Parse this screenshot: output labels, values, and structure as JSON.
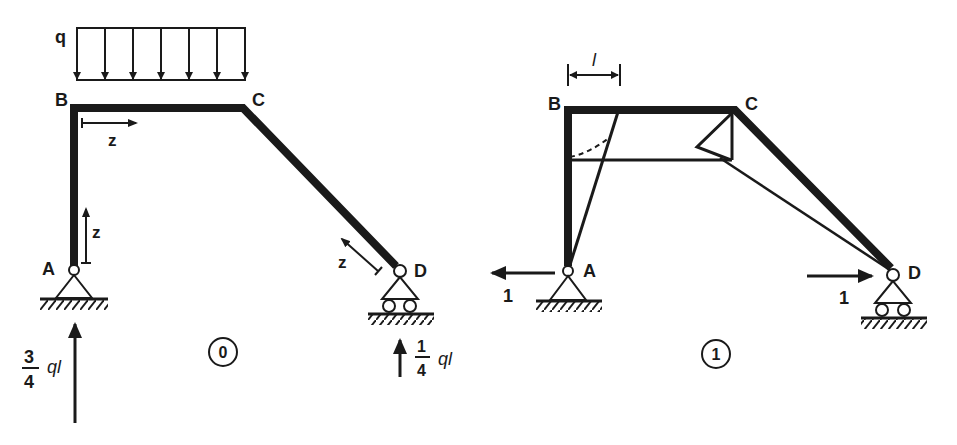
{
  "diagram": {
    "type": "structural-frame-analysis",
    "colors": {
      "ink": "#1a1a1a",
      "background": "#ffffff"
    },
    "panel_0": {
      "circle_label": "0",
      "load": {
        "symbol": "q",
        "type": "uniformly-distributed",
        "arrow_count": 7
      },
      "nodes": {
        "A": "A",
        "B": "B",
        "C": "C",
        "D": "D"
      },
      "coordinate_labels": {
        "BC": "z",
        "AB": "z",
        "CD": "z"
      },
      "reaction_A": {
        "num": "3",
        "den": "4",
        "unit": "ql",
        "direction": "up"
      },
      "reaction_D": {
        "num": "1",
        "den": "4",
        "unit": "ql",
        "direction": "up"
      },
      "supports": {
        "A": "pin",
        "D": "roller"
      }
    },
    "panel_1": {
      "circle_label": "1",
      "nodes": {
        "A": "A",
        "B": "B",
        "C": "C",
        "D": "D"
      },
      "dimension_label": "l",
      "load_A": {
        "value": "1",
        "direction": "left"
      },
      "load_D": {
        "value": "1",
        "direction": "right"
      },
      "supports": {
        "A": "pin",
        "D": "roller"
      }
    }
  }
}
